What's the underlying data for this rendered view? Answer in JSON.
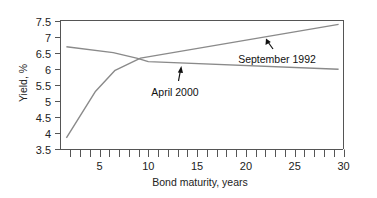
{
  "chart_data": {
    "type": "line",
    "title": "",
    "xlabel": "Bond maturity, years",
    "ylabel": "Yield, %",
    "xlim": [
      1,
      30
    ],
    "ylim": [
      3.5,
      7.5
    ],
    "x_ticks": [
      5,
      10,
      15,
      20,
      25,
      30
    ],
    "x_minor_ticks_every": 1,
    "y_ticks": [
      3.5,
      4,
      4.5,
      5,
      5.5,
      6,
      6.5,
      7,
      7.5
    ],
    "grid": false,
    "legend": null,
    "series": [
      {
        "name": "September 1992",
        "color": "#8a8a8a",
        "x": [
          1.6,
          4.6,
          6.6,
          9.2,
          29.5
        ],
        "y": [
          3.85,
          5.3,
          5.95,
          6.33,
          7.38
        ]
      },
      {
        "name": "April 2000",
        "color": "#8a8a8a",
        "x": [
          1.6,
          6.4,
          8.9,
          10,
          29.5
        ],
        "y": [
          6.68,
          6.5,
          6.32,
          6.22,
          5.98
        ]
      }
    ],
    "annotations": [
      {
        "text": "April 2000",
        "arrow_to_series": "April 2000",
        "label_x": 13.0,
        "label_y": 5.85
      },
      {
        "text": "September 1992",
        "arrow_to_series": "September 1992",
        "label_x": 22.5,
        "label_y": 6.3
      }
    ]
  }
}
